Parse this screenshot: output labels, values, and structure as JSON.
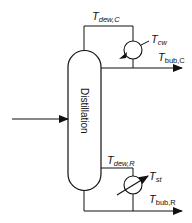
{
  "diagram": {
    "column_label": "Distillation",
    "labels": {
      "t_dew_c": {
        "main": "T",
        "sub": "dew,C"
      },
      "t_cw": {
        "main": "T",
        "sub": "cw"
      },
      "t_bub_c": {
        "main": "T",
        "sub": "bub,C"
      },
      "t_dew_r": {
        "main": "T",
        "sub": "dew,R"
      },
      "t_st": {
        "main": "T",
        "sub": "st"
      },
      "t_bub_r": {
        "main": "T",
        "sub": "bub,R"
      }
    },
    "colors": {
      "stroke": "#111111",
      "background": "#ffffff"
    }
  }
}
